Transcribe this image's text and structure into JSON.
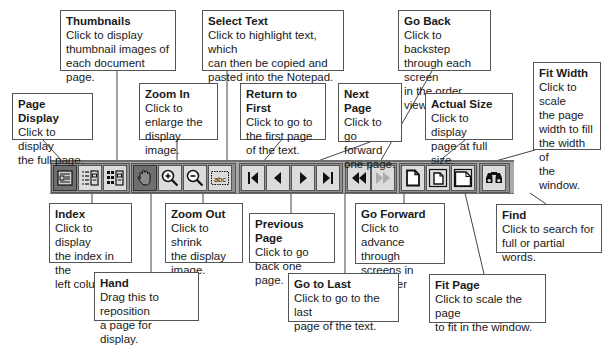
{
  "toolbar": {
    "background": "#a9a9a9",
    "buttons": [
      {
        "id": "page-display",
        "icon": "page-display-icon",
        "state": "pressed"
      },
      {
        "id": "index",
        "icon": "index-list-icon",
        "state": "normal"
      },
      {
        "id": "thumbnails",
        "icon": "thumbnails-grid-icon",
        "state": "normal"
      },
      {
        "id": "hand",
        "icon": "hand-icon",
        "state": "pressed"
      },
      {
        "id": "zoom-in",
        "icon": "zoom-in-icon",
        "state": "normal"
      },
      {
        "id": "zoom-out",
        "icon": "zoom-out-icon",
        "state": "normal"
      },
      {
        "id": "select-text",
        "icon": "select-text-abc-icon",
        "label": "abc",
        "state": "normal"
      },
      {
        "id": "return-to-first",
        "icon": "first-page-icon",
        "state": "normal"
      },
      {
        "id": "previous-page",
        "icon": "previous-page-icon",
        "state": "normal"
      },
      {
        "id": "next-page",
        "icon": "next-page-icon",
        "state": "normal"
      },
      {
        "id": "go-to-last",
        "icon": "last-page-icon",
        "state": "normal"
      },
      {
        "id": "go-back",
        "icon": "go-back-icon",
        "state": "normal"
      },
      {
        "id": "go-forward",
        "icon": "go-forward-icon",
        "state": "disabled"
      },
      {
        "id": "actual-size",
        "icon": "actual-size-page-icon",
        "state": "normal"
      },
      {
        "id": "fit-page",
        "icon": "fit-page-icon",
        "state": "normal"
      },
      {
        "id": "fit-width",
        "icon": "fit-width-icon",
        "state": "normal"
      },
      {
        "id": "find",
        "icon": "binoculars-icon",
        "state": "normal"
      }
    ]
  },
  "callouts": {
    "thumbnails": {
      "title": "Thumbnails",
      "desc": "Click to display\nthumbnail images of\neach document page."
    },
    "page_display": {
      "title": "Page Display",
      "desc": "Click to display\nthe full page."
    },
    "zoom_in": {
      "title": "Zoom In",
      "desc": "Click to\nenlarge the\ndisplay image."
    },
    "select_text": {
      "title": "Select Text",
      "desc": "Click to highlight text, which\ncan then be copied and\npasted into the Notepad."
    },
    "return_to_first": {
      "title": "Return to First",
      "desc": "Click to go to\nthe first page\nof the text."
    },
    "next_page": {
      "title": "Next Page",
      "desc": "Click to go\nforward\none page."
    },
    "go_back": {
      "title": "Go Back",
      "desc": "Click to backstep\nthrough each screen\nin the order viewed."
    },
    "actual_size": {
      "title": "Actual Size",
      "desc": "Click to display\npage at full size."
    },
    "fit_width": {
      "title": "Fit Width",
      "desc": "Click to scale\nthe page\nwidth to fill\nthe width of\nthe window."
    },
    "index": {
      "title": "Index",
      "desc": "Click to display\nthe index in the\nleft column."
    },
    "zoom_out": {
      "title": "Zoom Out",
      "desc": "Click to shrink\nthe display\nimage."
    },
    "hand": {
      "title": "Hand",
      "desc": "Drag this to reposition\na page for display."
    },
    "previous_page": {
      "title": "Previous Page",
      "desc": "Click to go\nback one page."
    },
    "go_forward": {
      "title": "Go Forward",
      "desc": "Click to advance\nthrough screens in\nthe order viewed."
    },
    "go_to_last": {
      "title": "Go to Last",
      "desc": "Click to go to the last\npage of the text."
    },
    "find": {
      "title": "Find",
      "desc": "Click to search for\nfull or partial words."
    },
    "fit_page": {
      "title": "Fit Page",
      "desc": "Click to scale the page\nto fit in the window."
    }
  }
}
